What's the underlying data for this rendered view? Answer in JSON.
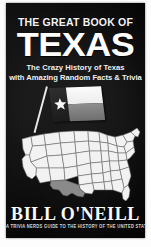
{
  "book_cover": {
    "background_color": "#0d0d0d",
    "text_color": "#ffffff",
    "kicker": "THE GREAT BOOK OF",
    "title": "TEXAS",
    "subtitle_line1": "The Crazy History of Texas",
    "subtitle_line2": "with Amazing Random Facts & Trivia",
    "author": "BILL O'NEILL",
    "series_line": "A TRIVIA NERDS GUIDE TO THE HISTORY OF THE UNITED STATES VOL 1",
    "flag": {
      "name": "texas-flag",
      "hoist_color": "#1b1b1b",
      "star_color": "#f7f7f7",
      "top_stripe_color": "#fbfbfb",
      "bottom_stripe_color": "#7e7e7e",
      "pole_color": "#e8e8e8"
    },
    "map": {
      "name": "united-states-map",
      "state_fill": "#f2f2f2",
      "state_stroke": "#6b6b6b",
      "highlighted_state": "Texas",
      "highlight_fill": "#8a8a8a"
    }
  }
}
